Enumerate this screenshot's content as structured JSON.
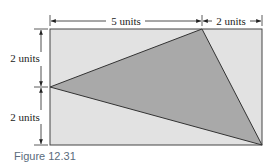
{
  "figure": {
    "caption": "Figure 12.31",
    "top_left_label": "5 units",
    "top_right_label": "2 units",
    "left_upper_label": "2 units",
    "left_lower_label": "2 units"
  },
  "colors": {
    "rectangle_fill": "#e2e2e2",
    "triangle_fill": "#a9a9a9",
    "stroke": "#333333",
    "caption": "#5a6b7c"
  }
}
